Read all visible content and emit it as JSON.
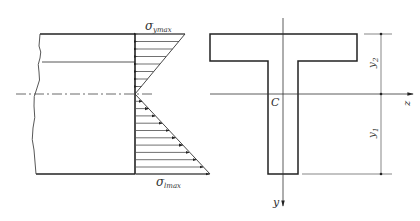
{
  "diagram": {
    "type": "beam-bending-stress-distribution",
    "left_view": {
      "description": "Beam elevation with linear bending stress distribution",
      "labels": {
        "sigma_top": "σ",
        "sigma_top_sub": "ymax",
        "sigma_bottom": "σ",
        "sigma_bottom_sub": "lmax"
      },
      "compression_arrows": 8,
      "tension_arrows": 11
    },
    "right_view": {
      "description": "T-shaped cross-section with centroid and axes",
      "labels": {
        "centroid": "C",
        "z_axis": "z",
        "y_axis": "y",
        "dim_top": "y",
        "dim_top_sub": "2",
        "dim_bottom": "y",
        "dim_bottom_sub": "1"
      }
    },
    "colors": {
      "line": "#2a2a2a",
      "thin_line": "#555555",
      "background": "#ffffff"
    }
  }
}
